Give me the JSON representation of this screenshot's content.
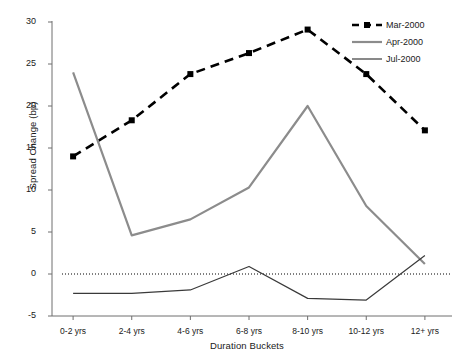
{
  "chart_data": {
    "type": "line",
    "title": "",
    "xlabel": "Duration Buckets",
    "ylabel": "Spread Change (bp)",
    "categories": [
      "0-2 yrs",
      "2-4 yrs",
      "4-6 yrs",
      "6-8 yrs",
      "8-10 yrs",
      "10-12 yrs",
      "12+ yrs"
    ],
    "ylim": [
      -5,
      30
    ],
    "yticks": [
      30,
      25,
      20,
      15,
      10,
      5,
      0,
      -5
    ],
    "grid": false,
    "zero_reference_line": true,
    "legend_position": "top-right",
    "series": [
      {
        "name": "Mar-2000",
        "color": "#000000",
        "style": "dashed",
        "marker": "square",
        "values": [
          14.0,
          18.3,
          23.8,
          26.3,
          29.1,
          23.8,
          17.1
        ]
      },
      {
        "name": "Apr-2000",
        "color": "#8c8c8c",
        "style": "solid",
        "marker": "none",
        "values": [
          24.0,
          4.6,
          6.5,
          10.3,
          20.0,
          8.1,
          1.2
        ]
      },
      {
        "name": "Jul-2000",
        "color": "#3a3a3a",
        "style": "solid",
        "marker": "none",
        "values": [
          -2.3,
          -2.3,
          -1.9,
          0.9,
          -2.9,
          -3.1,
          2.2
        ]
      }
    ]
  },
  "axis": {
    "y_title": "Spread Change (bp)",
    "x_title": "Duration Buckets",
    "y_tick_labels": [
      "30",
      "25",
      "20",
      "15",
      "10",
      "5",
      "0",
      "-5"
    ],
    "x_tick_labels": [
      "0-2 yrs",
      "2-4 yrs",
      "4-6 yrs",
      "6-8 yrs",
      "8-10 yrs",
      "10-12 yrs",
      "12+ yrs"
    ]
  },
  "legend": {
    "items": [
      {
        "label": "Mar-2000",
        "icon": "dashed-line-square-marker-icon"
      },
      {
        "label": "Apr-2000",
        "icon": "solid-gray-line-icon"
      },
      {
        "label": "Jul-2000",
        "icon": "solid-dark-line-icon"
      }
    ]
  },
  "colors": {
    "mar_2000": "#000000",
    "apr_2000": "#8c8c8c",
    "jul_2000": "#3a3a3a",
    "axis": "#6e6e6e",
    "background": "#ffffff"
  }
}
